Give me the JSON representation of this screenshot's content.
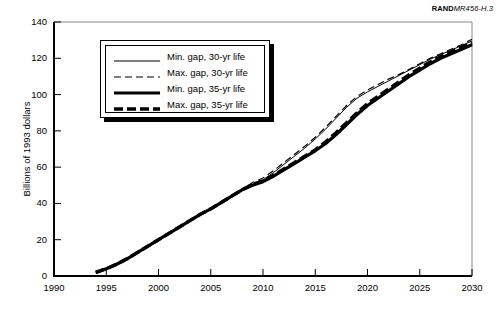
{
  "figure": {
    "id_prefix": "RAND",
    "id_suffix": "MR456-H.3"
  },
  "chart_data": {
    "type": "line",
    "title": "",
    "subtitle": "",
    "xlabel": "",
    "ylabel": "Billions of 1993 dollars",
    "xlim": [
      1990,
      2030
    ],
    "ylim": [
      0,
      140
    ],
    "xticks": [
      1990,
      1995,
      2000,
      2005,
      2010,
      2015,
      2020,
      2025,
      2030
    ],
    "yticks": [
      0,
      20,
      40,
      60,
      80,
      100,
      120,
      140
    ],
    "grid": false,
    "legend_position": "upper-left",
    "x": [
      1994,
      1995,
      1996,
      1997,
      1998,
      1999,
      2000,
      2001,
      2002,
      2003,
      2004,
      2005,
      2006,
      2007,
      2008,
      2009,
      2010,
      2011,
      2012,
      2013,
      2014,
      2015,
      2016,
      2017,
      2018,
      2019,
      2020,
      2021,
      2022,
      2023,
      2024,
      2025,
      2026,
      2027,
      2028,
      2029,
      2030
    ],
    "series": [
      {
        "name": "Min. gap, 30-yr life",
        "style": "thin-solid",
        "values": [
          2.0,
          4.0,
          6.5,
          9.5,
          13.0,
          16.5,
          20.0,
          23.5,
          27.0,
          30.5,
          34.0,
          37.0,
          40.5,
          44.0,
          47.5,
          50.5,
          53.0,
          57.0,
          61.5,
          66.0,
          70.5,
          75.5,
          81.0,
          87.0,
          93.0,
          98.0,
          101.5,
          104.5,
          107.5,
          110.5,
          113.5,
          116.5,
          119.5,
          122.0,
          124.5,
          127.0,
          129.5
        ]
      },
      {
        "name": "Max. gap, 30-yr life",
        "style": "thin-dashed",
        "values": [
          2.0,
          4.0,
          6.5,
          9.5,
          13.0,
          16.5,
          20.0,
          23.5,
          27.0,
          30.5,
          34.0,
          37.0,
          40.5,
          44.0,
          47.5,
          51.5,
          54.0,
          58.0,
          62.5,
          67.0,
          71.5,
          76.5,
          82.0,
          88.0,
          94.0,
          99.0,
          102.5,
          105.5,
          108.5,
          111.0,
          114.0,
          117.0,
          120.0,
          122.5,
          125.0,
          127.5,
          130.5
        ]
      },
      {
        "name": "Min. gap, 35-yr life",
        "style": "thick-solid",
        "values": [
          2.0,
          4.0,
          6.5,
          9.5,
          13.0,
          16.5,
          20.0,
          23.5,
          27.0,
          30.5,
          34.0,
          37.0,
          40.5,
          44.0,
          47.5,
          50.0,
          52.0,
          55.0,
          58.5,
          62.0,
          65.5,
          69.0,
          73.0,
          78.0,
          83.5,
          89.0,
          94.0,
          98.0,
          102.0,
          106.0,
          110.0,
          113.5,
          117.0,
          120.0,
          122.5,
          125.0,
          127.5
        ]
      },
      {
        "name": "Max. gap, 35-yr life",
        "style": "thick-dashed",
        "values": [
          2.0,
          4.0,
          6.5,
          9.5,
          13.0,
          16.5,
          20.0,
          23.5,
          27.0,
          30.5,
          34.0,
          37.0,
          40.5,
          44.0,
          47.5,
          50.5,
          52.5,
          55.5,
          59.0,
          62.5,
          66.0,
          69.5,
          74.0,
          79.0,
          84.5,
          90.0,
          95.0,
          99.0,
          103.0,
          107.0,
          111.0,
          114.5,
          118.0,
          121.0,
          123.5,
          126.0,
          128.5
        ]
      }
    ]
  }
}
